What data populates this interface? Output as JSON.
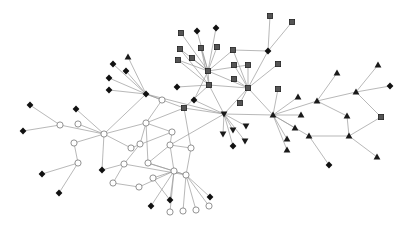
{
  "diagram": {
    "type": "network-graph",
    "background": "#ffffff",
    "edge_color": "#9a9a9a",
    "node_shapes": {
      "diamond": "#111111",
      "square": "#555555",
      "circle": "#ffffff",
      "triangle": "#1a1a1a",
      "triangle-down": "#1a1a1a"
    },
    "nodes": [
      {
        "id": "A",
        "shape": "diamond",
        "x": 146,
        "y": 94
      },
      {
        "id": "A1",
        "shape": "diamond",
        "x": 113,
        "y": 64
      },
      {
        "id": "A2",
        "shape": "triangle",
        "x": 128,
        "y": 57
      },
      {
        "id": "A3",
        "shape": "diamond",
        "x": 126,
        "y": 71
      },
      {
        "id": "A4",
        "shape": "diamond",
        "x": 109,
        "y": 78
      },
      {
        "id": "A5",
        "shape": "diamond",
        "x": 109,
        "y": 90
      },
      {
        "id": "A6",
        "shape": "circle",
        "x": 162,
        "y": 100
      },
      {
        "id": "B",
        "shape": "square",
        "x": 208,
        "y": 71
      },
      {
        "id": "B1",
        "shape": "square",
        "x": 181,
        "y": 33
      },
      {
        "id": "B2",
        "shape": "diamond",
        "x": 197,
        "y": 31
      },
      {
        "id": "B3",
        "shape": "diamond",
        "x": 216,
        "y": 28
      },
      {
        "id": "B4",
        "shape": "square",
        "x": 180,
        "y": 49
      },
      {
        "id": "B5",
        "shape": "square",
        "x": 201,
        "y": 48
      },
      {
        "id": "B6",
        "shape": "square",
        "x": 217,
        "y": 47
      },
      {
        "id": "B7",
        "shape": "square",
        "x": 178,
        "y": 60
      },
      {
        "id": "B8",
        "shape": "square",
        "x": 192,
        "y": 58
      },
      {
        "id": "B9",
        "shape": "square",
        "x": 233,
        "y": 50
      },
      {
        "id": "C",
        "shape": "square",
        "x": 209,
        "y": 85
      },
      {
        "id": "C1",
        "shape": "diamond",
        "x": 177,
        "y": 87
      },
      {
        "id": "C2",
        "shape": "diamond",
        "x": 194,
        "y": 100
      },
      {
        "id": "C3",
        "shape": "square",
        "x": 184,
        "y": 108
      },
      {
        "id": "D",
        "shape": "square",
        "x": 248,
        "y": 88
      },
      {
        "id": "D1",
        "shape": "square",
        "x": 234,
        "y": 65
      },
      {
        "id": "D2",
        "shape": "square",
        "x": 248,
        "y": 65
      },
      {
        "id": "D3",
        "shape": "square",
        "x": 234,
        "y": 79
      },
      {
        "id": "D4",
        "shape": "square",
        "x": 240,
        "y": 103
      },
      {
        "id": "K",
        "shape": "diamond",
        "x": 268,
        "y": 51
      },
      {
        "id": "K1",
        "shape": "square",
        "x": 270,
        "y": 16
      },
      {
        "id": "K2",
        "shape": "square",
        "x": 292,
        "y": 22
      },
      {
        "id": "K3",
        "shape": "square",
        "x": 278,
        "y": 64
      },
      {
        "id": "K4",
        "shape": "square",
        "x": 278,
        "y": 89
      },
      {
        "id": "E",
        "shape": "tridown",
        "x": 224,
        "y": 114
      },
      {
        "id": "E1",
        "shape": "tridown",
        "x": 223,
        "y": 134
      },
      {
        "id": "E2",
        "shape": "tridown",
        "x": 233,
        "y": 130
      },
      {
        "id": "E3",
        "shape": "tridown",
        "x": 246,
        "y": 126
      },
      {
        "id": "E4",
        "shape": "tridown",
        "x": 245,
        "y": 141
      },
      {
        "id": "E5",
        "shape": "diamond",
        "x": 233,
        "y": 146
      },
      {
        "id": "F",
        "shape": "triangle",
        "x": 273,
        "y": 115
      },
      {
        "id": "F1",
        "shape": "triangle",
        "x": 298,
        "y": 97
      },
      {
        "id": "F2",
        "shape": "triangle",
        "x": 301,
        "y": 115
      },
      {
        "id": "F3",
        "shape": "triangle",
        "x": 295,
        "y": 128
      },
      {
        "id": "F4",
        "shape": "triangle",
        "x": 287,
        "y": 139
      },
      {
        "id": "F5",
        "shape": "triangle",
        "x": 287,
        "y": 150
      },
      {
        "id": "F6",
        "shape": "triangle",
        "x": 309,
        "y": 136
      },
      {
        "id": "F7",
        "shape": "diamond",
        "x": 329,
        "y": 165
      },
      {
        "id": "G",
        "shape": "triangle",
        "x": 317,
        "y": 101
      },
      {
        "id": "G1",
        "shape": "triangle",
        "x": 337,
        "y": 73
      },
      {
        "id": "G2",
        "shape": "triangle",
        "x": 347,
        "y": 116
      },
      {
        "id": "G3",
        "shape": "triangle",
        "x": 349,
        "y": 136
      },
      {
        "id": "H",
        "shape": "triangle",
        "x": 356,
        "y": 92
      },
      {
        "id": "H1",
        "shape": "triangle",
        "x": 378,
        "y": 65
      },
      {
        "id": "H2",
        "shape": "diamond",
        "x": 390,
        "y": 86
      },
      {
        "id": "H3",
        "shape": "square",
        "x": 381,
        "y": 117
      },
      {
        "id": "H4",
        "shape": "triangle",
        "x": 377,
        "y": 157
      },
      {
        "id": "O",
        "shape": "circle",
        "x": 104,
        "y": 134
      },
      {
        "id": "O1",
        "shape": "diamond",
        "x": 30,
        "y": 105
      },
      {
        "id": "O2",
        "shape": "circle",
        "x": 60,
        "y": 125
      },
      {
        "id": "O3",
        "shape": "diamond",
        "x": 23,
        "y": 131
      },
      {
        "id": "O4",
        "shape": "diamond",
        "x": 76,
        "y": 109
      },
      {
        "id": "O5",
        "shape": "circle",
        "x": 78,
        "y": 124
      },
      {
        "id": "O6",
        "shape": "circle",
        "x": 74,
        "y": 143
      },
      {
        "id": "O7",
        "shape": "circle",
        "x": 78,
        "y": 163
      },
      {
        "id": "O8",
        "shape": "diamond",
        "x": 42,
        "y": 174
      },
      {
        "id": "O9",
        "shape": "diamond",
        "x": 59,
        "y": 193
      },
      {
        "id": "O10",
        "shape": "diamond",
        "x": 102,
        "y": 170
      },
      {
        "id": "P",
        "shape": "circle",
        "x": 146,
        "y": 123
      },
      {
        "id": "P1",
        "shape": "circle",
        "x": 140,
        "y": 144
      },
      {
        "id": "P2",
        "shape": "circle",
        "x": 131,
        "y": 148
      },
      {
        "id": "P3",
        "shape": "circle",
        "x": 148,
        "y": 163
      },
      {
        "id": "P4",
        "shape": "circle",
        "x": 124,
        "y": 164
      },
      {
        "id": "P5",
        "shape": "circle",
        "x": 113,
        "y": 183
      },
      {
        "id": "P6",
        "shape": "circle",
        "x": 139,
        "y": 187
      },
      {
        "id": "P7",
        "shape": "circle",
        "x": 170,
        "y": 145
      },
      {
        "id": "P8",
        "shape": "circle",
        "x": 191,
        "y": 148
      },
      {
        "id": "P9",
        "shape": "circle",
        "x": 153,
        "y": 178
      },
      {
        "id": "P10",
        "shape": "circle",
        "x": 174,
        "y": 171
      },
      {
        "id": "P11",
        "shape": "circle",
        "x": 186,
        "y": 175
      },
      {
        "id": "P12",
        "shape": "diamond",
        "x": 151,
        "y": 206
      },
      {
        "id": "P13",
        "shape": "diamond",
        "x": 170,
        "y": 200
      },
      {
        "id": "P14",
        "shape": "diamond",
        "x": 210,
        "y": 197
      },
      {
        "id": "P15",
        "shape": "circle",
        "x": 170,
        "y": 212
      },
      {
        "id": "P16",
        "shape": "circle",
        "x": 183,
        "y": 211
      },
      {
        "id": "P17",
        "shape": "circle",
        "x": 196,
        "y": 210
      },
      {
        "id": "P18",
        "shape": "circle",
        "x": 209,
        "y": 206
      },
      {
        "id": "P19",
        "shape": "circle",
        "x": 172,
        "y": 132
      }
    ],
    "edges": [
      [
        "A",
        "A1"
      ],
      [
        "A",
        "A2"
      ],
      [
        "A",
        "A3"
      ],
      [
        "A",
        "A4"
      ],
      [
        "A",
        "A5"
      ],
      [
        "A",
        "A6"
      ],
      [
        "A",
        "O"
      ],
      [
        "A",
        "C3"
      ],
      [
        "A",
        "E"
      ],
      [
        "B",
        "B1"
      ],
      [
        "B",
        "B2"
      ],
      [
        "B",
        "B3"
      ],
      [
        "B",
        "B4"
      ],
      [
        "B",
        "B5"
      ],
      [
        "B",
        "B6"
      ],
      [
        "B",
        "B7"
      ],
      [
        "B",
        "B8"
      ],
      [
        "B",
        "B9"
      ],
      [
        "B",
        "C"
      ],
      [
        "B",
        "D"
      ],
      [
        "B",
        "C2"
      ],
      [
        "B",
        "D2"
      ],
      [
        "C",
        "C1"
      ],
      [
        "C",
        "C3"
      ],
      [
        "C",
        "D"
      ],
      [
        "C",
        "E"
      ],
      [
        "C",
        "B4"
      ],
      [
        "C",
        "B5"
      ],
      [
        "C",
        "B7"
      ],
      [
        "D",
        "D1"
      ],
      [
        "D",
        "D2"
      ],
      [
        "D",
        "D3"
      ],
      [
        "D",
        "D4"
      ],
      [
        "D",
        "K"
      ],
      [
        "D",
        "E"
      ],
      [
        "D",
        "F"
      ],
      [
        "D",
        "B9"
      ],
      [
        "K",
        "K1"
      ],
      [
        "K",
        "K2"
      ],
      [
        "K",
        "B9"
      ],
      [
        "K3",
        "D"
      ],
      [
        "K4",
        "F"
      ],
      [
        "E",
        "E1"
      ],
      [
        "E",
        "E2"
      ],
      [
        "E",
        "E3"
      ],
      [
        "E",
        "E4"
      ],
      [
        "E",
        "E5"
      ],
      [
        "E",
        "F"
      ],
      [
        "E",
        "P7"
      ],
      [
        "E",
        "C3"
      ],
      [
        "E",
        "C2"
      ],
      [
        "F",
        "F1"
      ],
      [
        "F",
        "F2"
      ],
      [
        "F",
        "F3"
      ],
      [
        "F",
        "F4"
      ],
      [
        "F",
        "F5"
      ],
      [
        "F",
        "F6"
      ],
      [
        "F",
        "G"
      ],
      [
        "F6",
        "F7"
      ],
      [
        "F6",
        "G3"
      ],
      [
        "G",
        "G1"
      ],
      [
        "G",
        "G2"
      ],
      [
        "G",
        "H"
      ],
      [
        "H",
        "H1"
      ],
      [
        "H",
        "H2"
      ],
      [
        "H",
        "H3"
      ],
      [
        "G2",
        "G3"
      ],
      [
        "G3",
        "H3"
      ],
      [
        "G3",
        "H4"
      ],
      [
        "O",
        "O4"
      ],
      [
        "O",
        "O2"
      ],
      [
        "O",
        "O5"
      ],
      [
        "O",
        "O6"
      ],
      [
        "O",
        "O10"
      ],
      [
        "O",
        "P"
      ],
      [
        "O",
        "P2"
      ],
      [
        "O2",
        "O1"
      ],
      [
        "O2",
        "O3"
      ],
      [
        "O6",
        "O7"
      ],
      [
        "O7",
        "O8"
      ],
      [
        "O7",
        "O9"
      ],
      [
        "O10",
        "P4"
      ],
      [
        "P",
        "P1"
      ],
      [
        "P",
        "P3"
      ],
      [
        "P",
        "P19"
      ],
      [
        "P",
        "A6"
      ],
      [
        "P",
        "C3"
      ],
      [
        "P1",
        "P4"
      ],
      [
        "P2",
        "P19"
      ],
      [
        "P19",
        "P7"
      ],
      [
        "P3",
        "P7"
      ],
      [
        "P3",
        "P10"
      ],
      [
        "P3",
        "P11"
      ],
      [
        "P4",
        "P5"
      ],
      [
        "P4",
        "P11"
      ],
      [
        "P5",
        "P6"
      ],
      [
        "P6",
        "P10"
      ],
      [
        "P7",
        "P10"
      ],
      [
        "P7",
        "P8"
      ],
      [
        "P8",
        "P11"
      ],
      [
        "P8",
        "C3"
      ],
      [
        "P10",
        "P11"
      ],
      [
        "P10",
        "P12"
      ],
      [
        "P10",
        "P13"
      ],
      [
        "P10",
        "P15"
      ],
      [
        "P10",
        "P9"
      ],
      [
        "P11",
        "P14"
      ],
      [
        "P11",
        "P16"
      ],
      [
        "P11",
        "P17"
      ],
      [
        "P11",
        "P18"
      ],
      [
        "P9",
        "P13"
      ]
    ]
  }
}
